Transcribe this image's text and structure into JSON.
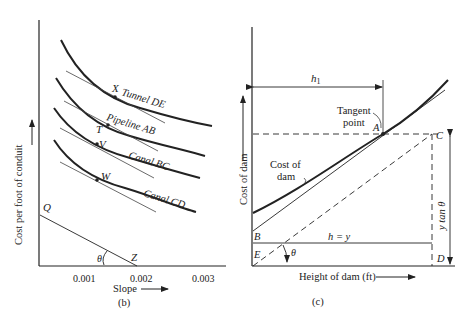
{
  "panel_b": {
    "caption": "(b)",
    "ylabel": "Cost per foot of conduit",
    "xlabel": "Slope",
    "xticks": [
      "0.001",
      "0.002",
      "0.003"
    ],
    "curves": [
      {
        "label": "Tunnel DE",
        "point": "X"
      },
      {
        "label": "Pipeline AB",
        "point": "T"
      },
      {
        "label": "Canal BC",
        "point": "V"
      },
      {
        "label": "Canal CD",
        "point": "W"
      }
    ],
    "line_labels": {
      "start": "Q",
      "end": "Z",
      "angle": "θ"
    }
  },
  "panel_c": {
    "caption": "(c)",
    "ylabel": "Cost of dam",
    "xlabel": "Height of dam (ft)",
    "h1_label": "h",
    "h1_sub": "1",
    "tangent_label_1": "Tangent",
    "tangent_label_2": "point",
    "curve_label_1": "Cost of",
    "curve_label_2": "dam",
    "points": {
      "A": "A",
      "B": "B",
      "C": "C",
      "D": "D",
      "E": "E"
    },
    "h_eq_y": "h = y",
    "y_tan": "y tan θ",
    "angle": "θ"
  }
}
